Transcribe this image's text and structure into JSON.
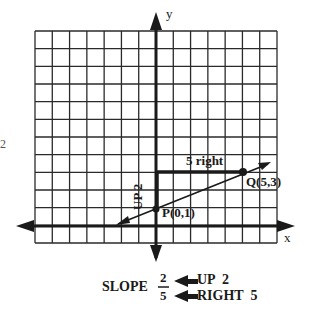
{
  "figure": {
    "axis_labels": {
      "x": "x",
      "y": "y"
    },
    "points": [
      {
        "name": "P",
        "label": "P(0,1)",
        "x": 0,
        "y": 1
      },
      {
        "name": "Q",
        "label": "Q(5,3)",
        "x": 5,
        "y": 3
      }
    ],
    "rise_label": "UP 2",
    "run_label": "5 right",
    "margin_mark": "2",
    "grid": {
      "columns": 14,
      "rows": 12,
      "x_min": -7,
      "x_max": 7,
      "y_min": -1,
      "y_max": 11
    }
  },
  "slope_note": {
    "prefix": "SLOPE",
    "numerator": "2",
    "denominator": "5",
    "numerator_note": "UP  2",
    "denominator_note": "RIGHT  5"
  },
  "colors": {
    "ink": "#1a1a1a",
    "background": "#ffffff"
  }
}
